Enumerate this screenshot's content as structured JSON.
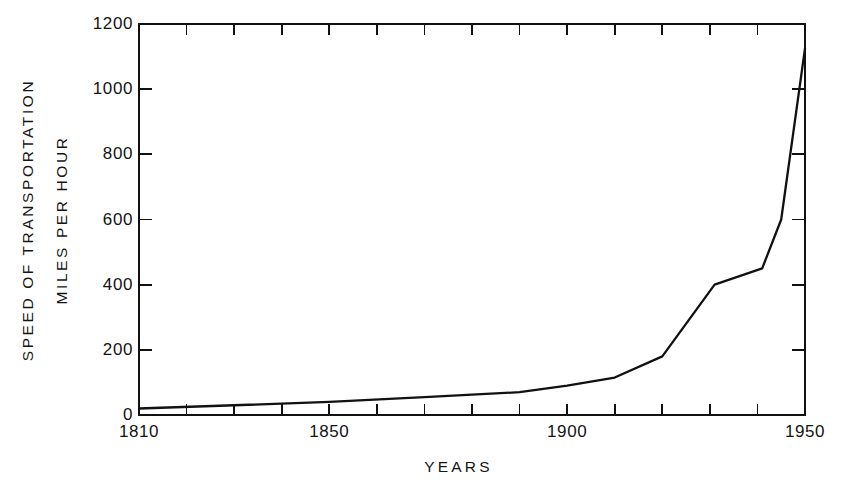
{
  "chart_data": {
    "type": "line",
    "title": "",
    "subtitle": "",
    "xlabel": "YEARS",
    "ylabel": "SPEED OF TRANSPORTATION MILES PER HOUR",
    "ylabel_lines": [
      "SPEED OF TRANSPORTATION",
      "MILES PER HOUR"
    ],
    "xlim": [
      1810,
      1950
    ],
    "ylim": [
      0,
      1200
    ],
    "grid": false,
    "legend": null,
    "x_tick_labels": [
      "1810",
      "1850",
      "1900",
      "1950"
    ],
    "x_tick_label_values": [
      1810,
      1850,
      1900,
      1950
    ],
    "x_minor_ticks": [
      1820,
      1830,
      1840,
      1850,
      1860,
      1870,
      1880,
      1890,
      1900,
      1910,
      1920,
      1930,
      1940
    ],
    "x_tick_interval": 10,
    "y_tick_labels": [
      "0",
      "200",
      "400",
      "600",
      "800",
      "1000",
      "1200"
    ],
    "y_tick_label_values": [
      0,
      200,
      400,
      600,
      800,
      1000,
      1200
    ],
    "y_tick_interval": 200,
    "tick_direction": "in",
    "axes_style": "box",
    "line_color": "#111111",
    "background_color": "#ffffff",
    "series": [
      {
        "name": "Speed of transportation",
        "x": [
          1810,
          1830,
          1850,
          1870,
          1890,
          1900,
          1910,
          1920,
          1931,
          1941,
          1945,
          1950
        ],
        "values": [
          20,
          30,
          40,
          55,
          70,
          90,
          115,
          180,
          400,
          450,
          600,
          1125
        ]
      }
    ]
  },
  "figure": {
    "plot_area": {
      "left": 139,
      "top": 24,
      "right": 805,
      "bottom": 415
    }
  }
}
